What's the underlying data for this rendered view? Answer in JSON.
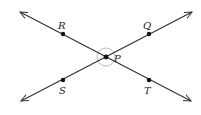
{
  "diagram": {
    "title": "",
    "colors": {
      "line": "#333333",
      "point": "#111111",
      "angle_arc": "#bbbbbb",
      "label": "#222222",
      "background": "#ffffff"
    },
    "center": {
      "name": "P",
      "x": 106,
      "y": 57
    },
    "lines": [
      {
        "name": "line-RT",
        "from": [
          20,
          12
        ],
        "to": [
          191,
          101
        ],
        "through": [
          "R",
          "P",
          "T"
        ],
        "arrows": "both"
      },
      {
        "name": "line-SQ",
        "from": [
          21,
          101
        ],
        "to": [
          192,
          12
        ],
        "through": [
          "S",
          "P",
          "Q"
        ],
        "arrows": "both"
      }
    ],
    "points": [
      {
        "name": "R",
        "label": "R",
        "x": 63,
        "y": 34,
        "label_x": 62,
        "label_y": 28
      },
      {
        "name": "Q",
        "label": "Q",
        "x": 149,
        "y": 34,
        "label_x": 147,
        "label_y": 28
      },
      {
        "name": "P",
        "label": "P",
        "x": 106,
        "y": 57,
        "label_x": 116,
        "label_y": 62
      },
      {
        "name": "S",
        "label": "S",
        "x": 63,
        "y": 80,
        "label_x": 61,
        "label_y": 94
      },
      {
        "name": "T",
        "label": "T",
        "x": 149,
        "y": 80,
        "label_x": 146,
        "label_y": 94
      }
    ],
    "angle_marks": {
      "type": "circle",
      "center": "P",
      "radius": 9
    }
  }
}
